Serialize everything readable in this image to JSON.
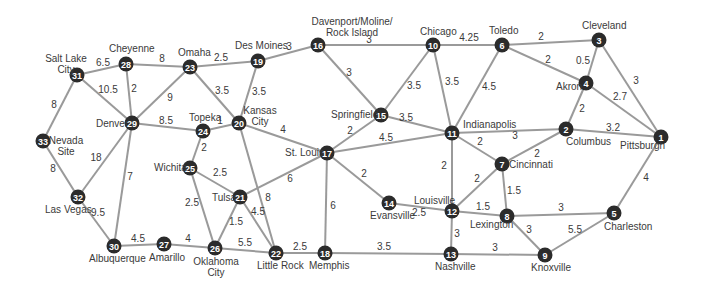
{
  "diagram": {
    "type": "weighted-graph",
    "nodes": [
      {
        "id": "1",
        "city": [
          "Pittsburgh"
        ],
        "x": 661,
        "y": 137,
        "lx": 620,
        "ly": 149,
        "anchor": "start"
      },
      {
        "id": "2",
        "city": [
          "Columbus"
        ],
        "x": 566,
        "y": 129,
        "lx": 566,
        "ly": 145,
        "anchor": "start"
      },
      {
        "id": "3",
        "city": [
          "Cleveland"
        ],
        "x": 599,
        "y": 40,
        "lx": 582,
        "ly": 29,
        "anchor": "start"
      },
      {
        "id": "4",
        "city": [
          "Akron"
        ],
        "x": 586,
        "y": 83,
        "lx": 556,
        "ly": 90,
        "anchor": "start"
      },
      {
        "id": "5",
        "city": [
          "Charleston"
        ],
        "x": 614,
        "y": 213,
        "lx": 604,
        "ly": 230,
        "anchor": "start"
      },
      {
        "id": "6",
        "city": [
          "Toledo"
        ],
        "x": 502,
        "y": 45,
        "lx": 489,
        "ly": 34,
        "anchor": "start"
      },
      {
        "id": "7",
        "city": [
          "Cincinnati"
        ],
        "x": 502,
        "y": 164,
        "lx": 509,
        "ly": 168,
        "anchor": "start"
      },
      {
        "id": "8",
        "city": [
          "Lexington"
        ],
        "x": 507,
        "y": 216,
        "lx": 470,
        "ly": 228,
        "anchor": "start"
      },
      {
        "id": "9",
        "city": [
          "Knoxville"
        ],
        "x": 545,
        "y": 255,
        "lx": 531,
        "ly": 271,
        "anchor": "start"
      },
      {
        "id": "10",
        "city": [
          "Chicago"
        ],
        "x": 433,
        "y": 45,
        "lx": 420,
        "ly": 35,
        "anchor": "start"
      },
      {
        "id": "11",
        "city": [
          "Indianapolis"
        ],
        "x": 452,
        "y": 133,
        "lx": 463,
        "ly": 128,
        "anchor": "start"
      },
      {
        "id": "12",
        "city": [
          "Louisville"
        ],
        "x": 452,
        "y": 211,
        "lx": 414,
        "ly": 204,
        "anchor": "start"
      },
      {
        "id": "13",
        "city": [
          "Nashville"
        ],
        "x": 451,
        "y": 254,
        "lx": 435,
        "ly": 270,
        "anchor": "start"
      },
      {
        "id": "14",
        "city": [
          "Evansville"
        ],
        "x": 389,
        "y": 203,
        "lx": 370,
        "ly": 219,
        "anchor": "start"
      },
      {
        "id": "15",
        "city": [
          "Springfield"
        ],
        "x": 381,
        "y": 115,
        "lx": 331,
        "ly": 118,
        "anchor": "start"
      },
      {
        "id": "16",
        "city": [
          "Davenport/Moline/",
          "Rock Island"
        ],
        "x": 318,
        "y": 45,
        "lx": 286,
        "ly": 25,
        "anchor": "start"
      },
      {
        "id": "17",
        "city": [
          "St. Louis"
        ],
        "x": 327,
        "y": 153,
        "lx": 285,
        "ly": 156,
        "anchor": "start"
      },
      {
        "id": "18",
        "city": [
          "Memphis"
        ],
        "x": 325,
        "y": 253,
        "lx": 309,
        "ly": 269,
        "anchor": "start"
      },
      {
        "id": "19",
        "city": [
          "Des Moines"
        ],
        "x": 258,
        "y": 61,
        "lx": 235,
        "ly": 49,
        "anchor": "start"
      },
      {
        "id": "20",
        "city": [
          "Kansas",
          "City"
        ],
        "x": 239,
        "y": 123,
        "lx": 249,
        "ly": 114,
        "anchor": "start"
      },
      {
        "id": "21",
        "city": [
          "Tulsa"
        ],
        "x": 240,
        "y": 197,
        "lx": 212,
        "ly": 201,
        "anchor": "start"
      },
      {
        "id": "22",
        "city": [
          "Little Rock"
        ],
        "x": 276,
        "y": 253,
        "lx": 257,
        "ly": 269,
        "anchor": "start"
      },
      {
        "id": "23",
        "city": [
          "Omaha"
        ],
        "x": 190,
        "y": 67,
        "lx": 178,
        "ly": 56,
        "anchor": "start"
      },
      {
        "id": "24",
        "city": [
          "Topeka"
        ],
        "x": 203,
        "y": 131,
        "lx": 189,
        "ly": 121,
        "anchor": "start"
      },
      {
        "id": "25",
        "city": [
          "Wichita"
        ],
        "x": 190,
        "y": 168,
        "lx": 154,
        "ly": 171,
        "anchor": "start"
      },
      {
        "id": "26",
        "city": [
          "Oklahoma",
          "City"
        ],
        "x": 215,
        "y": 248,
        "lx": 196,
        "ly": 265,
        "anchor": "start"
      },
      {
        "id": "27",
        "city": [
          "Amarillo"
        ],
        "x": 164,
        "y": 244,
        "lx": 149,
        "ly": 261,
        "anchor": "start"
      },
      {
        "id": "28",
        "city": [
          "Cheyenne"
        ],
        "x": 126,
        "y": 64,
        "lx": 109,
        "ly": 52,
        "anchor": "start"
      },
      {
        "id": "29",
        "city": [
          "Denver"
        ],
        "x": 132,
        "y": 123,
        "lx": 96,
        "ly": 127,
        "anchor": "start"
      },
      {
        "id": "30",
        "city": [
          "Albuquerque"
        ],
        "x": 114,
        "y": 246,
        "lx": 89,
        "ly": 262,
        "anchor": "start"
      },
      {
        "id": "31",
        "city": [
          "Salt Lake",
          "City"
        ],
        "x": 77,
        "y": 75,
        "lx": 47,
        "ly": 62,
        "anchor": "start"
      },
      {
        "id": "32",
        "city": [
          "Las Vegas"
        ],
        "x": 78,
        "y": 197,
        "lx": 45,
        "ly": 213,
        "anchor": "start"
      },
      {
        "id": "33",
        "city": [
          "Nevada",
          "Site"
        ],
        "x": 43,
        "y": 141,
        "lx": 53,
        "ly": 144,
        "anchor": "start"
      }
    ],
    "edges": [
      {
        "from": "31",
        "to": "28",
        "weight": "6.5",
        "wx": 103,
        "wy": 66
      },
      {
        "from": "28",
        "to": "23",
        "weight": "8",
        "wx": 162,
        "wy": 62
      },
      {
        "from": "23",
        "to": "19",
        "weight": "2.5",
        "wx": 221,
        "wy": 61
      },
      {
        "from": "19",
        "to": "16",
        "weight": "3",
        "wx": 289,
        "wy": 50
      },
      {
        "from": "16",
        "to": "10",
        "weight": "3",
        "wx": 369,
        "wy": 43
      },
      {
        "from": "10",
        "to": "6",
        "weight": "4.25",
        "wx": 469,
        "wy": 41
      },
      {
        "from": "6",
        "to": "3",
        "weight": "2",
        "wx": 541,
        "wy": 40
      },
      {
        "from": "31",
        "to": "29",
        "weight": "10.5",
        "wx": 108,
        "wy": 93
      },
      {
        "from": "28",
        "to": "29",
        "weight": "2",
        "wx": 134,
        "wy": 92
      },
      {
        "from": "23",
        "to": "29",
        "weight": "9",
        "wx": 170,
        "wy": 101
      },
      {
        "from": "23",
        "to": "20",
        "weight": "3.5",
        "wx": 222,
        "wy": 94
      },
      {
        "from": "19",
        "to": "20",
        "weight": "3.5",
        "wx": 259,
        "wy": 95
      },
      {
        "from": "16",
        "to": "15",
        "weight": "3",
        "wx": 349,
        "wy": 76
      },
      {
        "from": "10",
        "to": "15",
        "weight": "3.5",
        "wx": 414,
        "wy": 89
      },
      {
        "from": "10",
        "to": "11",
        "weight": "3.5",
        "wx": 452,
        "wy": 85
      },
      {
        "from": "6",
        "to": "11",
        "weight": "4.5",
        "wx": 489,
        "wy": 90
      },
      {
        "from": "6",
        "to": "4",
        "weight": "2",
        "wx": 548,
        "wy": 63
      },
      {
        "from": "3",
        "to": "4",
        "weight": "0.5",
        "wx": 583,
        "wy": 64
      },
      {
        "from": "3",
        "to": "1",
        "weight": "3",
        "wx": 636,
        "wy": 84
      },
      {
        "from": "4",
        "to": "1",
        "weight": "2.7",
        "wx": 620,
        "wy": 100
      },
      {
        "from": "4",
        "to": "2",
        "weight": "2",
        "wx": 582,
        "wy": 112
      },
      {
        "from": "2",
        "to": "1",
        "weight": "3.2",
        "wx": 613,
        "wy": 131
      },
      {
        "from": "31",
        "to": "33",
        "weight": "8",
        "wx": 54,
        "wy": 108
      },
      {
        "from": "29",
        "to": "24",
        "weight": "8.5",
        "wx": 166,
        "wy": 124
      },
      {
        "from": "24",
        "to": "20",
        "weight": "1",
        "wx": 220,
        "wy": 124
      },
      {
        "from": "20",
        "to": "17",
        "weight": "4",
        "wx": 283,
        "wy": 133
      },
      {
        "from": "15",
        "to": "11",
        "weight": "3.5",
        "wx": 406,
        "wy": 121
      },
      {
        "from": "15",
        "to": "17",
        "weight": "2",
        "wx": 350,
        "wy": 134
      },
      {
        "from": "17",
        "to": "11",
        "weight": "4.5",
        "wx": 386,
        "wy": 141
      },
      {
        "from": "11",
        "to": "2",
        "weight": "3",
        "wx": 515,
        "wy": 139
      },
      {
        "from": "11",
        "to": "7",
        "weight": "2",
        "wx": 480,
        "wy": 145
      },
      {
        "from": "2",
        "to": "7",
        "weight": "2",
        "wx": 537,
        "wy": 157
      },
      {
        "from": "29",
        "to": "32",
        "weight": "18",
        "wx": 96,
        "wy": 161
      },
      {
        "from": "33",
        "to": "32",
        "weight": "8",
        "wx": 53,
        "wy": 172
      },
      {
        "from": "29",
        "to": "30",
        "weight": "7",
        "wx": 130,
        "wy": 180
      },
      {
        "from": "24",
        "to": "25",
        "weight": "2",
        "wx": 204,
        "wy": 151
      },
      {
        "from": "25",
        "to": "21",
        "weight": "2.5",
        "wx": 220,
        "wy": 176
      },
      {
        "from": "20",
        "to": "22",
        "weight": "8",
        "wx": 268,
        "wy": 201
      },
      {
        "from": "17",
        "to": "21",
        "weight": "6",
        "wx": 290,
        "wy": 182
      },
      {
        "from": "17",
        "to": "14",
        "weight": "2",
        "wx": 364,
        "wy": 177
      },
      {
        "from": "17",
        "to": "18",
        "weight": "6",
        "wx": 333,
        "wy": 209
      },
      {
        "from": "11",
        "to": "12",
        "weight": "2",
        "wx": 444,
        "wy": 169
      },
      {
        "from": "7",
        "to": "12",
        "weight": "2",
        "wx": 477,
        "wy": 182
      },
      {
        "from": "7",
        "to": "8",
        "weight": "1.5",
        "wx": 514,
        "wy": 194
      },
      {
        "from": "1",
        "to": "5",
        "weight": "4",
        "wx": 646,
        "wy": 181
      },
      {
        "from": "32",
        "to": "30",
        "weight": "9.5",
        "wx": 98,
        "wy": 216
      },
      {
        "from": "25",
        "to": "26",
        "weight": "2.5",
        "wx": 192,
        "wy": 206
      },
      {
        "from": "21",
        "to": "26",
        "weight": "1.5",
        "wx": 236,
        "wy": 225
      },
      {
        "from": "21",
        "to": "22",
        "weight": "4.5",
        "wx": 258,
        "wy": 215
      },
      {
        "from": "14",
        "to": "12",
        "weight": "2.5",
        "wx": 419,
        "wy": 216
      },
      {
        "from": "12",
        "to": "8",
        "weight": "1.5",
        "wx": 483,
        "wy": 210
      },
      {
        "from": "8",
        "to": "5",
        "weight": "3",
        "wx": 561,
        "wy": 211
      },
      {
        "from": "12",
        "to": "13",
        "weight": "3",
        "wx": 457,
        "wy": 237
      },
      {
        "from": "8",
        "to": "9",
        "weight": "3",
        "wx": 529,
        "wy": 233
      },
      {
        "from": "5",
        "to": "9",
        "weight": "5.5",
        "wx": 575,
        "wy": 233
      },
      {
        "from": "30",
        "to": "27",
        "weight": "4.5",
        "wx": 138,
        "wy": 242
      },
      {
        "from": "27",
        "to": "26",
        "weight": "4",
        "wx": 188,
        "wy": 242
      },
      {
        "from": "26",
        "to": "22",
        "weight": "5.5",
        "wx": 245,
        "wy": 246
      },
      {
        "from": "22",
        "to": "18",
        "weight": "2.5",
        "wx": 300,
        "wy": 250
      },
      {
        "from": "18",
        "to": "13",
        "weight": "3.5",
        "wx": 384,
        "wy": 250
      },
      {
        "from": "13",
        "to": "9",
        "weight": "3",
        "wx": 495,
        "wy": 251
      }
    ]
  }
}
